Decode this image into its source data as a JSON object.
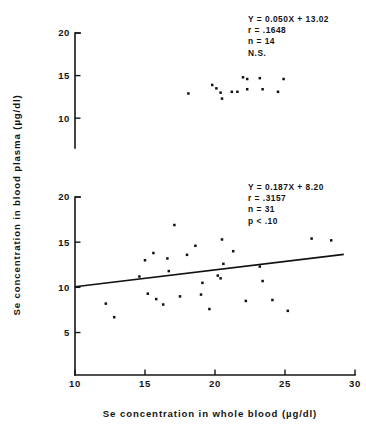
{
  "figure": {
    "background": "#ffffff",
    "ink_color": "#111111"
  },
  "axis_titles": {
    "x": "Se concentration in whole blood (µg/dl)",
    "y": "Se concentration in blood plasma (µg/dl)"
  },
  "chart_data": [
    {
      "type": "scatter",
      "title": "",
      "panel": "upper",
      "xlabel": "Se concentration in whole blood (µg/dl)",
      "ylabel": "Se concentration in blood plasma (µg/dl)",
      "xlim": [
        10,
        30
      ],
      "ylim": [
        6,
        20
      ],
      "xticks": [
        10,
        15,
        20,
        25,
        30
      ],
      "yticks": [
        10,
        15,
        20
      ],
      "xtick_labels": [
        "10",
        "15",
        "20",
        "25",
        "30"
      ],
      "ytick_labels": [
        "10",
        "15",
        "20"
      ],
      "grid": false,
      "legend": "none",
      "regression_line_drawn": false,
      "annotations": [
        "Y = 0.050X + 13.02",
        "r = .1648",
        "n = 14",
        "N.S."
      ],
      "stats": {
        "equation": "Y = 0.050X + 13.02",
        "slope": 0.05,
        "intercept": 13.02,
        "r": 0.1648,
        "n": 14,
        "significance": "N.S."
      },
      "points": [
        {
          "x": 18.1,
          "y": 12.9
        },
        {
          "x": 19.8,
          "y": 13.9
        },
        {
          "x": 20.1,
          "y": 13.5
        },
        {
          "x": 20.4,
          "y": 13.0
        },
        {
          "x": 20.5,
          "y": 12.3
        },
        {
          "x": 21.2,
          "y": 13.1
        },
        {
          "x": 21.6,
          "y": 13.1
        },
        {
          "x": 22.0,
          "y": 14.8
        },
        {
          "x": 22.3,
          "y": 14.6
        },
        {
          "x": 22.3,
          "y": 13.4
        },
        {
          "x": 23.2,
          "y": 14.7
        },
        {
          "x": 23.4,
          "y": 13.4
        },
        {
          "x": 24.5,
          "y": 13.1
        },
        {
          "x": 24.9,
          "y": 14.6
        }
      ]
    },
    {
      "type": "scatter",
      "title": "",
      "panel": "lower",
      "xlabel": "Se concentration in whole blood (µg/dl)",
      "ylabel": "Se concentration in blood plasma (µg/dl)",
      "xlim": [
        10,
        30
      ],
      "ylim": [
        2,
        20
      ],
      "xticks": [
        10,
        15,
        20,
        25,
        30
      ],
      "yticks": [
        5,
        10,
        15,
        20
      ],
      "xtick_labels": [
        "10",
        "15",
        "20",
        "25",
        "30"
      ],
      "ytick_labels": [
        "5",
        "10",
        "15",
        "20"
      ],
      "grid": false,
      "legend": "none",
      "regression_line_drawn": true,
      "regression_segment": {
        "x0": 10.0,
        "y0": 10.07,
        "x1": 29.2,
        "y1": 13.66
      },
      "annotations": [
        "Y = 0.187X + 8.20",
        "r = .3157",
        "n = 31",
        "p < .10"
      ],
      "stats": {
        "equation": "Y = 0.187X + 8.20",
        "slope": 0.187,
        "intercept": 8.2,
        "r": 0.3157,
        "n": 31,
        "significance": "p < .10"
      },
      "points": [
        {
          "x": 12.2,
          "y": 8.2
        },
        {
          "x": 12.8,
          "y": 6.7
        },
        {
          "x": 14.6,
          "y": 11.2
        },
        {
          "x": 15.0,
          "y": 13.0
        },
        {
          "x": 15.2,
          "y": 9.3
        },
        {
          "x": 15.6,
          "y": 13.8
        },
        {
          "x": 15.8,
          "y": 8.7
        },
        {
          "x": 16.3,
          "y": 8.1
        },
        {
          "x": 16.6,
          "y": 13.2
        },
        {
          "x": 16.7,
          "y": 11.8
        },
        {
          "x": 17.1,
          "y": 16.9
        },
        {
          "x": 17.5,
          "y": 9.0
        },
        {
          "x": 18.0,
          "y": 13.6
        },
        {
          "x": 18.6,
          "y": 14.6
        },
        {
          "x": 19.0,
          "y": 9.2
        },
        {
          "x": 19.1,
          "y": 10.5
        },
        {
          "x": 19.6,
          "y": 7.6
        },
        {
          "x": 20.2,
          "y": 11.3
        },
        {
          "x": 20.4,
          "y": 11.0
        },
        {
          "x": 20.5,
          "y": 15.3
        },
        {
          "x": 20.6,
          "y": 12.6
        },
        {
          "x": 21.3,
          "y": 14.0
        },
        {
          "x": 22.2,
          "y": 8.5
        },
        {
          "x": 23.2,
          "y": 12.3
        },
        {
          "x": 23.4,
          "y": 10.7
        },
        {
          "x": 24.1,
          "y": 8.6
        },
        {
          "x": 25.2,
          "y": 7.4
        },
        {
          "x": 26.9,
          "y": 15.4
        },
        {
          "x": 28.3,
          "y": 15.2
        }
      ]
    }
  ]
}
